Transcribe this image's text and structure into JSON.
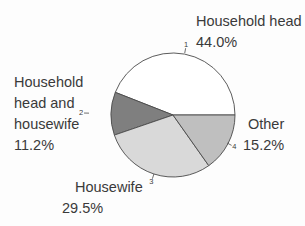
{
  "chart_data": {
    "type": "pie",
    "title": "",
    "start_angle_deg": 0,
    "direction": "counterclockwise",
    "outline_color": "#4a4a4a",
    "text_color": "#3a3a3a",
    "legend_position": "none",
    "slices": [
      {
        "index": "1",
        "label": "Household head",
        "value": 44.0,
        "pct_label": "44.0%",
        "color": "#ffffff",
        "label_lines": [
          "Household head"
        ]
      },
      {
        "index": "2",
        "label": "Household head and housewife",
        "value": 11.2,
        "pct_label": "11.2%",
        "color": "#7f7f7f",
        "label_lines": [
          "Household",
          "head and",
          "housewife"
        ]
      },
      {
        "index": "3",
        "label": "Housewife",
        "value": 29.5,
        "pct_label": "29.5%",
        "color": "#d9d9d9",
        "label_lines": [
          "Housewife"
        ]
      },
      {
        "index": "4",
        "label": "Other",
        "value": 15.2,
        "pct_label": "15.2%",
        "color": "#bfbfbf",
        "label_lines": [
          "Other"
        ]
      }
    ]
  }
}
